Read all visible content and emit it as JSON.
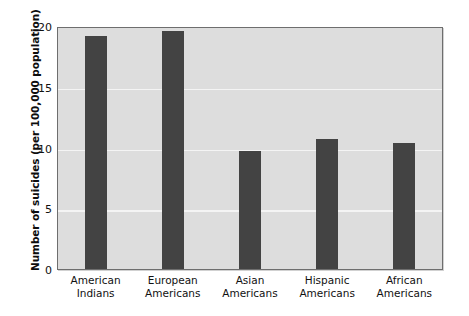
{
  "chart_data": {
    "type": "bar",
    "title": "",
    "xlabel": "",
    "ylabel": "Number of suicides (per 100,000 population)",
    "categories": [
      "American Indians",
      "European Americans",
      "Asian Americans",
      "Hispanic Americans",
      "African Americans"
    ],
    "category_lines": [
      [
        "American",
        "Indians"
      ],
      [
        "European",
        "Americans"
      ],
      [
        "Asian",
        "Americans"
      ],
      [
        "Hispanic",
        "Americans"
      ],
      [
        "African",
        "Americans"
      ]
    ],
    "values": [
      19.2,
      19.6,
      9.7,
      10.7,
      10.4
    ],
    "ylim": [
      0,
      20
    ],
    "yticks": [
      20,
      15,
      10,
      5,
      0
    ],
    "ytick_labels": [
      "20",
      "15",
      "10",
      "5",
      "0"
    ],
    "grid": true,
    "gridlines_at": [
      15,
      10,
      5
    ],
    "legend": "none",
    "colors": {
      "bar": "#434343",
      "plot_background": "#dddddd",
      "gridline": "#f4f4f4",
      "axis_border": "#6e6e6e",
      "text": "#111111",
      "figure_background": "#ffffff"
    }
  }
}
